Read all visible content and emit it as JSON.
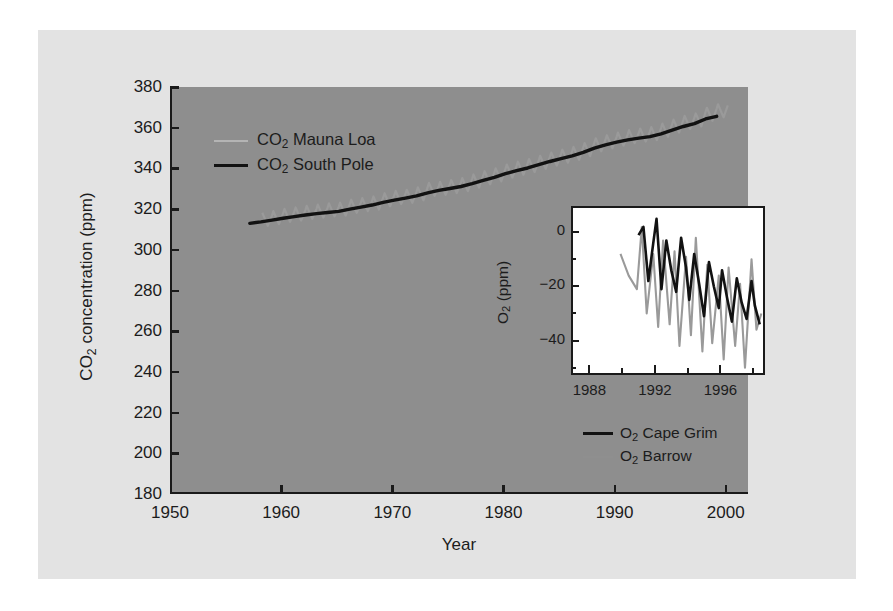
{
  "figure": {
    "background_color": "#e3e3e3",
    "plot_background_color": "#8e8e8e",
    "inset_background_color": "#ffffff",
    "axis_color": "#1a1a1a",
    "series_black_color": "#121212",
    "series_gray_color": "#9a9a9a"
  },
  "chart_data": [
    {
      "type": "line",
      "id": "main",
      "title": "",
      "xlabel": "Year",
      "ylabel": "CO2 concentration (ppm)",
      "ylabel_parts": {
        "pre": "CO",
        "sub": "2",
        "post": " concentration (ppm)"
      },
      "xlim": [
        1950,
        2002
      ],
      "ylim": [
        180,
        380
      ],
      "xticks": [
        1950,
        1960,
        1970,
        1980,
        1990,
        2000
      ],
      "yticks": [
        180,
        200,
        220,
        240,
        260,
        280,
        300,
        320,
        340,
        360,
        380
      ],
      "grid": false,
      "legend_position": "upper-left-inside",
      "series": [
        {
          "name": "CO2 Mauna Loa",
          "name_parts": {
            "pre": "CO",
            "sub": "2",
            "post": " Mauna Loa"
          },
          "color": "#9a9a9a",
          "style": "sawtooth-seasonal",
          "seasonal_amplitude_ppm": 3.2,
          "x": [
            1958,
            1959,
            1960,
            1961,
            1962,
            1963,
            1964,
            1965,
            1966,
            1967,
            1968,
            1969,
            1970,
            1971,
            1972,
            1973,
            1974,
            1975,
            1976,
            1977,
            1978,
            1979,
            1980,
            1981,
            1982,
            1983,
            1984,
            1985,
            1986,
            1987,
            1988,
            1989,
            1990,
            1991,
            1992,
            1993,
            1994,
            1995,
            1996,
            1997,
            1998,
            1999
          ],
          "values": [
            315.0,
            315.8,
            316.9,
            317.6,
            318.4,
            319.0,
            319.6,
            320.0,
            321.4,
            322.2,
            323.0,
            324.6,
            325.7,
            326.3,
            327.5,
            329.7,
            330.2,
            331.1,
            332.0,
            333.8,
            335.4,
            336.8,
            338.7,
            340.1,
            341.4,
            343.0,
            344.6,
            346.0,
            347.4,
            349.2,
            351.6,
            353.1,
            354.4,
            355.6,
            356.4,
            357.1,
            358.8,
            360.8,
            362.6,
            363.8,
            366.6,
            368.3
          ]
        },
        {
          "name": "CO2 South Pole",
          "name_parts": {
            "pre": "CO",
            "sub": "2",
            "post": " South Pole"
          },
          "color": "#121212",
          "style": "smooth",
          "x": [
            1957,
            1958,
            1959,
            1960,
            1961,
            1962,
            1963,
            1964,
            1965,
            1966,
            1967,
            1968,
            1969,
            1970,
            1971,
            1972,
            1973,
            1974,
            1975,
            1976,
            1977,
            1978,
            1979,
            1980,
            1981,
            1982,
            1983,
            1984,
            1985,
            1986,
            1987,
            1988,
            1989,
            1990,
            1991,
            1992,
            1993,
            1994,
            1995,
            1996,
            1997,
            1998,
            1999
          ],
          "values": [
            313.0,
            313.7,
            314.6,
            315.5,
            316.3,
            317.1,
            317.8,
            318.3,
            318.9,
            320.0,
            321.0,
            322.0,
            323.3,
            324.4,
            325.4,
            326.5,
            328.0,
            329.2,
            330.1,
            331.1,
            332.5,
            334.1,
            335.6,
            337.4,
            338.9,
            340.2,
            341.8,
            343.4,
            344.8,
            346.2,
            347.9,
            350.0,
            351.6,
            352.9,
            354.0,
            354.9,
            355.6,
            357.0,
            358.8,
            360.6,
            362.0,
            364.3,
            365.6
          ]
        }
      ]
    },
    {
      "type": "line",
      "id": "inset",
      "title": "",
      "xlabel": "",
      "ylabel": "O2 (ppm)",
      "ylabel_parts": {
        "pre": "O",
        "sub": "2",
        "post": " (ppm)"
      },
      "xlim": [
        1987,
        1998.6
      ],
      "ylim": [
        -52,
        9
      ],
      "xticks": [
        1988,
        1992,
        1996
      ],
      "xticks_minor": [
        1990,
        1994,
        1998
      ],
      "yticks": [
        0,
        -20,
        -40
      ],
      "ytick_labels": [
        "0",
        "−20",
        "−40"
      ],
      "yticks_minor": [
        -10,
        -30,
        -50
      ],
      "grid": false,
      "legend_position": "below-right",
      "series": [
        {
          "name": "O2 Cape Grim",
          "name_parts": {
            "pre": "O",
            "sub": "2",
            "post": " Cape Grim"
          },
          "color": "#121212",
          "x": [
            1991.0,
            1991.3,
            1991.6,
            1991.9,
            1992.1,
            1992.4,
            1992.7,
            1993.0,
            1993.3,
            1993.6,
            1993.9,
            1994.1,
            1994.4,
            1994.7,
            1995.0,
            1995.3,
            1995.6,
            1995.9,
            1996.1,
            1996.4,
            1996.7,
            1997.0,
            1997.3,
            1997.6,
            1997.9,
            1998.1,
            1998.4
          ],
          "values": [
            -1.0,
            2.0,
            -18.0,
            -4.0,
            5.0,
            -21.0,
            -3.0,
            -14.0,
            -22.0,
            -2.0,
            -13.0,
            -25.0,
            -8.0,
            -19.0,
            -31.0,
            -11.0,
            -20.0,
            -28.0,
            -14.0,
            -24.0,
            -33.0,
            -17.0,
            -26.0,
            -32.0,
            -18.0,
            -27.0,
            -34.0
          ]
        },
        {
          "name": "O2 Barrow",
          "name_parts": {
            "pre": "O",
            "sub": "2",
            "post": " Barrow"
          },
          "color": "#9a9a9a",
          "x": [
            1989.9,
            1990.4,
            1990.9,
            1991.2,
            1991.5,
            1991.9,
            1992.2,
            1992.5,
            1992.9,
            1993.2,
            1993.5,
            1993.9,
            1994.2,
            1994.5,
            1994.9,
            1995.2,
            1995.5,
            1995.9,
            1996.2,
            1996.5,
            1996.9,
            1997.2,
            1997.5,
            1997.9,
            1998.2,
            1998.5
          ],
          "values": [
            -8.0,
            -16.0,
            -21.0,
            2.0,
            -30.0,
            -8.0,
            -35.0,
            -3.0,
            -34.0,
            -7.0,
            -42.0,
            -9.0,
            -38.0,
            -2.0,
            -44.0,
            -12.0,
            -41.0,
            -16.0,
            -47.0,
            -13.0,
            -42.0,
            -19.0,
            -50.0,
            -10.0,
            -36.0,
            -30.0
          ]
        }
      ]
    }
  ]
}
